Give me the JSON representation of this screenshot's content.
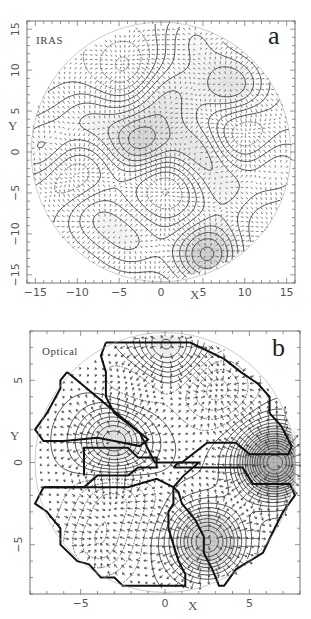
{
  "chart_data": [
    {
      "panel": "a",
      "type": "vector-field-contour",
      "title": "",
      "tag": "IRAS",
      "panel_letter": "a",
      "xlabel": "X",
      "ylabel": "Y",
      "xlim": [
        -16,
        16
      ],
      "ylim": [
        -16,
        16
      ],
      "xticks": [
        -15,
        -10,
        -5,
        0,
        5,
        10,
        15
      ],
      "yticks": [
        -15,
        -10,
        -5,
        0,
        5,
        10,
        15
      ],
      "xtick_labels": [
        "−15",
        "−10",
        "−5",
        "0",
        "5",
        "10",
        "15"
      ],
      "ytick_labels": [
        "−15",
        "−10",
        "−5",
        "0",
        "5",
        "10",
        "15"
      ],
      "domain_radius": 15.5,
      "contour_centers": [
        {
          "x": -2.5,
          "y": 1.0,
          "sign": 1,
          "strength": 6
        },
        {
          "x": 0.5,
          "y": 7.0,
          "sign": 1,
          "strength": 4
        },
        {
          "x": 8.5,
          "y": 8.0,
          "sign": 1,
          "strength": 5
        },
        {
          "x": 4.5,
          "y": 0.0,
          "sign": 1,
          "strength": 5
        },
        {
          "x": 5.5,
          "y": -12.5,
          "sign": 1,
          "strength": 7
        },
        {
          "x": -14.0,
          "y": 0.0,
          "sign": 1,
          "strength": 4
        },
        {
          "x": -8.5,
          "y": 4.0,
          "sign": 1,
          "strength": 3
        },
        {
          "x": -8.0,
          "y": -7.5,
          "sign": 1,
          "strength": 3
        },
        {
          "x": -3.5,
          "y": -11.0,
          "sign": 1,
          "strength": 3
        },
        {
          "x": 7.5,
          "y": -4.5,
          "sign": 1,
          "strength": 3
        },
        {
          "x": 14.0,
          "y": -2.0,
          "sign": 1,
          "strength": 3
        },
        {
          "x": 4.0,
          "y": 14.0,
          "sign": 1,
          "strength": 3
        },
        {
          "x": -4.0,
          "y": 10.0,
          "sign": -1,
          "strength": 3
        },
        {
          "x": 9.0,
          "y": 2.0,
          "sign": -1,
          "strength": 3
        },
        {
          "x": 1.0,
          "y": -3.5,
          "sign": -1,
          "strength": 3
        },
        {
          "x": -11.0,
          "y": -2.5,
          "sign": -1,
          "strength": 3
        }
      ],
      "arrow_grid_spacing": 0.6
    },
    {
      "panel": "b",
      "type": "vector-field-contour",
      "title": "",
      "tag": "Optical",
      "panel_letter": "b",
      "xlabel": "X",
      "ylabel": "Y",
      "xlim": [
        -8,
        8
      ],
      "ylim": [
        -8,
        8
      ],
      "xticks": [
        -5,
        0,
        5
      ],
      "yticks": [
        -5,
        0,
        5
      ],
      "xtick_labels": [
        "−5",
        "0",
        "5"
      ],
      "ytick_labels": [
        "−5",
        "0",
        "5"
      ],
      "domain_radius": 7.7,
      "contour_centers": [
        {
          "x": 0.0,
          "y": 7.0,
          "sign": 1,
          "strength": 5
        },
        {
          "x": -3.0,
          "y": 1.2,
          "sign": 1,
          "strength": 6
        },
        {
          "x": 6.5,
          "y": 0.0,
          "sign": 1,
          "strength": 12
        },
        {
          "x": 2.5,
          "y": -4.8,
          "sign": 1,
          "strength": 8
        },
        {
          "x": -1.5,
          "y": 5.0,
          "sign": -1,
          "strength": 2
        },
        {
          "x": 3.0,
          "y": 4.5,
          "sign": -1,
          "strength": 3
        },
        {
          "x": -4.0,
          "y": -5.0,
          "sign": -1,
          "strength": 3
        },
        {
          "x": -3.0,
          "y": -2.0,
          "sign": -1,
          "strength": 3
        }
      ],
      "arrow_grid_spacing": 0.45,
      "survey_mask_polygons": [
        [
          [
            -3.5,
            7.3
          ],
          [
            1.5,
            7.3
          ],
          [
            3.5,
            6.3
          ],
          [
            4.5,
            5.5
          ],
          [
            5.5,
            4.8
          ],
          [
            6.2,
            4.0
          ],
          [
            6.2,
            3.0
          ],
          [
            6.9,
            2.2
          ],
          [
            7.5,
            1.0
          ],
          [
            7.3,
            0.5
          ],
          [
            5.0,
            0.5
          ],
          [
            4.2,
            1.2
          ],
          [
            2.5,
            1.2
          ],
          [
            1.0,
            0.0
          ],
          [
            -0.6,
            0.0
          ],
          [
            -1.5,
            1.8
          ],
          [
            -3.0,
            3.0
          ],
          [
            -3.5,
            4.0
          ],
          [
            -3.5,
            5.5
          ],
          [
            -3.8,
            6.5
          ],
          [
            -3.5,
            7.3
          ]
        ],
        [
          [
            -5.8,
            5.5
          ],
          [
            -1.0,
            1.4
          ],
          [
            -1.5,
            1.0
          ],
          [
            -3.0,
            1.3
          ],
          [
            -4.0,
            1.5
          ],
          [
            -6.0,
            1.3
          ],
          [
            -7.2,
            1.3
          ],
          [
            -7.7,
            2.0
          ],
          [
            -7.0,
            3.0
          ],
          [
            -6.2,
            4.5
          ],
          [
            -6.2,
            5.0
          ],
          [
            -5.8,
            5.5
          ]
        ],
        [
          [
            -7.2,
            -1.5
          ],
          [
            -4.8,
            -1.5
          ],
          [
            -4.0,
            -0.8
          ],
          [
            -2.2,
            -0.8
          ],
          [
            -1.6,
            -0.3
          ],
          [
            -0.5,
            -0.3
          ],
          [
            -0.5,
            0.3
          ],
          [
            -1.6,
            0.3
          ],
          [
            -2.2,
            0.9
          ],
          [
            -4.8,
            0.9
          ],
          [
            -4.8,
            -0.8
          ]
        ],
        [
          [
            0.5,
            -0.3
          ],
          [
            4.6,
            -0.3
          ],
          [
            5.2,
            -1.3
          ],
          [
            7.4,
            -1.3
          ],
          [
            7.7,
            -2.0
          ],
          [
            7.0,
            -3.0
          ],
          [
            6.5,
            -4.0
          ],
          [
            5.8,
            -5.5
          ],
          [
            5.0,
            -6.0
          ],
          [
            4.2,
            -6.5
          ],
          [
            3.5,
            -7.5
          ],
          [
            3.2,
            -7.5
          ],
          [
            2.8,
            -6.5
          ],
          [
            2.3,
            -5.5
          ],
          [
            2.3,
            -4.5
          ],
          [
            1.8,
            -3.5
          ],
          [
            1.0,
            -2.5
          ],
          [
            0.8,
            -1.8
          ],
          [
            0.5,
            -1.5
          ],
          [
            1.1,
            -0.8
          ],
          [
            2.0,
            0.0
          ],
          [
            0.8,
            0.0
          ],
          [
            0.5,
            -0.3
          ]
        ],
        [
          [
            -7.2,
            -1.5
          ],
          [
            -7.7,
            -2.5
          ],
          [
            -7.0,
            -3.0
          ],
          [
            -6.2,
            -4.0
          ],
          [
            -6.2,
            -5.0
          ],
          [
            -5.2,
            -6.0
          ],
          [
            -4.5,
            -6.2
          ],
          [
            -3.8,
            -7.0
          ],
          [
            -3.0,
            -7.0
          ],
          [
            -2.5,
            -7.5
          ],
          [
            1.2,
            -7.5
          ],
          [
            1.2,
            -6.8
          ],
          [
            0.8,
            -6.0
          ],
          [
            0.2,
            -4.0
          ],
          [
            0.2,
            -3.0
          ],
          [
            0.5,
            -2.5
          ],
          [
            0.5,
            -1.5
          ],
          [
            -0.5,
            -1.0
          ],
          [
            -2.2,
            -1.5
          ],
          [
            -4.0,
            -1.5
          ],
          [
            -5.0,
            -1.5
          ],
          [
            -7.2,
            -1.5
          ]
        ]
      ]
    }
  ],
  "panel_a": {
    "tag": "IRAS",
    "letter": "a",
    "xlabel": "X",
    "ylabel": "Y"
  },
  "panel_b": {
    "tag": "Optical",
    "letter": "b",
    "xlabel": "X",
    "ylabel": "Y"
  }
}
